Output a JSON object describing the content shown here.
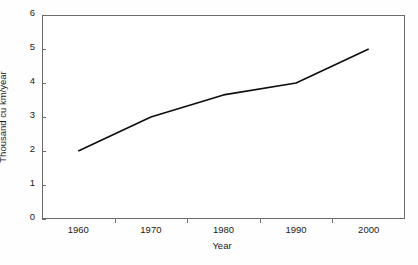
{
  "chart_data": {
    "type": "line",
    "title": "",
    "xlabel": "Year",
    "ylabel": "Thousand cu km/year",
    "categories": [
      1960,
      1970,
      1980,
      1990,
      2000
    ],
    "x_tick_labels": [
      "1960",
      "1970",
      "1980",
      "1990",
      "2000"
    ],
    "series": [
      {
        "name": "Water use",
        "values": [
          2.0,
          3.0,
          3.65,
          4.0,
          5.0
        ]
      }
    ],
    "xlim": [
      1955,
      2005
    ],
    "ylim": [
      0,
      6
    ],
    "y_tick_labels": [
      "0",
      "1",
      "2",
      "3",
      "4",
      "5",
      "6"
    ],
    "y_ticks": [
      0,
      1,
      2,
      3,
      4,
      5,
      6
    ],
    "y_tick_interval": 1,
    "grid": false,
    "legend": false,
    "legend_position": "none",
    "line_color": "#0d0d0d",
    "axis_color": "#6b6b6b",
    "background_color": "#ffffff",
    "markers": false
  }
}
